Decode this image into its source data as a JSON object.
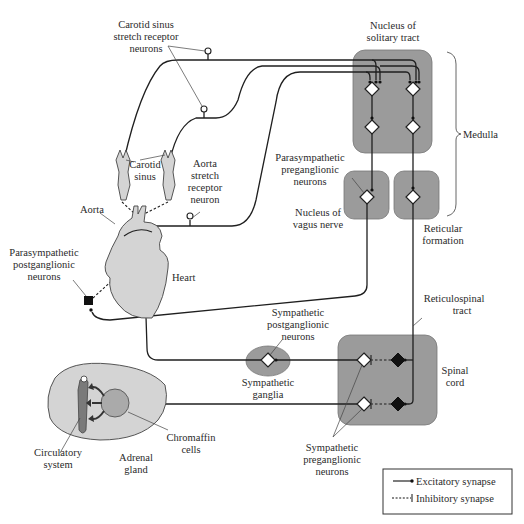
{
  "figure": {
    "type": "neural-circuit diagram"
  },
  "labels": {
    "carotid_sinus_receptor": [
      "Carotid sinus",
      "stretch receptor",
      "neurons"
    ],
    "nucleus_solitary": [
      "Nucleus of",
      "solitary tract"
    ],
    "medulla": "Medulla",
    "carotid_sinus": [
      "Carotid",
      "sinus"
    ],
    "aorta_receptor": [
      "Aorta",
      "stretch",
      "receptor",
      "neuron"
    ],
    "parasym_pregang": [
      "Parasympathetic",
      "preganglionic",
      "neurons"
    ],
    "nucleus_vagus": [
      "Nucleus of",
      "vagus nerve"
    ],
    "reticular_formation": [
      "Reticular",
      "formation"
    ],
    "aorta": "Aorta",
    "parasym_postgang": [
      "Parasympathetic",
      "postganglionic",
      "neurons"
    ],
    "heart": "Heart",
    "reticulospinal": [
      "Reticulospinal",
      "tract"
    ],
    "sym_postgang": [
      "Sympathetic",
      "postganglionic",
      "neurons"
    ],
    "sym_ganglia": [
      "Sympathetic",
      "ganglia"
    ],
    "spinal_cord": [
      "Spinal",
      "cord"
    ],
    "chromaffin": [
      "Chromaffin",
      "cells"
    ],
    "circulatory": [
      "Circulatory",
      "system"
    ],
    "adrenal": [
      "Adrenal",
      "gland"
    ],
    "sym_pregang": [
      "Sympathetic",
      "preganglionic",
      "neurons"
    ]
  },
  "legend": {
    "excitatory": "Excitatory synapse",
    "inhibitory": "Inhibitory synapse"
  },
  "colors": {
    "region_fill": "#9b9b9b",
    "organ_fill": "#d4d4d4",
    "line": "#1f1f1f"
  }
}
